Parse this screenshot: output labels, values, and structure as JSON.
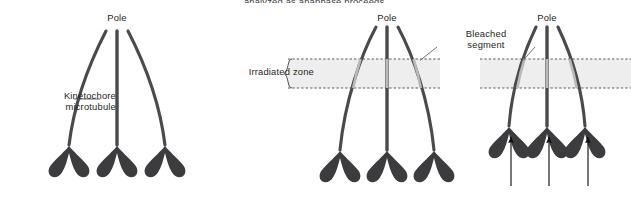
{
  "figure": {
    "caption_top": "analyzed as anaphase proceeds.",
    "labels": {
      "kinetochore_microtubule": "Kinetochore\nmicrotubule",
      "irradiated_zone": "Irradiated zone",
      "bleached_segment": "Bleached\nsegment",
      "pole": "Pole"
    },
    "colors": {
      "fiber": "#4a4a4d",
      "fiber_bleached": "#b9b9bb",
      "chromosome": "#3c3c3f",
      "band_fill": "#eeeeee",
      "band_border": "#4a4a4d",
      "leader": "#5a5a5c",
      "arrow": "#111111",
      "text": "#231f20",
      "background": "#ffffff"
    },
    "panels": [
      {
        "name": "panel-before-irradiation",
        "pole_label": "Pole",
        "pole_x": 117,
        "pole_y": 30,
        "has_irradiated_zone": false,
        "has_bleached_segments": false,
        "has_arrows": false,
        "chromosome_count": 3,
        "chromosome_y": 148
      },
      {
        "name": "panel-irradiated",
        "pole_label": "Pole",
        "pole_x": 387,
        "pole_y": 26,
        "has_irradiated_zone": true,
        "has_bleached_segments": true,
        "has_arrows": false,
        "chromosome_count": 3,
        "chromosome_y": 152
      },
      {
        "name": "panel-anaphase-progress",
        "pole_label": "Pole",
        "pole_x": 547,
        "pole_y": 26,
        "has_irradiated_zone": true,
        "has_bleached_segments": true,
        "has_arrows": true,
        "chromosome_count": 3,
        "chromosome_y": 128
      }
    ],
    "irradiated_zone": {
      "top": 59,
      "bottom": 88,
      "segments": [
        {
          "name": "zone-band-middle-panel",
          "x": 288,
          "width": 152
        },
        {
          "name": "zone-band-right-panel",
          "x": 480,
          "width": 151
        }
      ]
    },
    "arrows": {
      "count": 3,
      "x_positions": [
        511,
        549,
        588
      ],
      "y_tail": 186,
      "y_head": 136
    }
  }
}
